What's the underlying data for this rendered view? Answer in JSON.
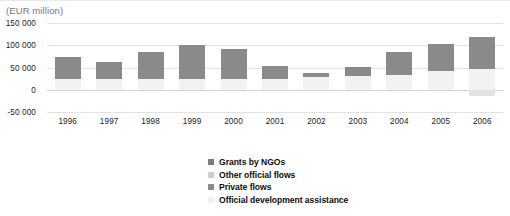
{
  "unit_caption": "(EUR million)",
  "legend": {
    "items": [
      {
        "label": "Grants by NGOs",
        "color": "#7d7d7d"
      },
      {
        "label": "Other official flows",
        "color": "#cfcfcf"
      },
      {
        "label": "Private flows",
        "color": "#8a8a8a"
      },
      {
        "label": "Official development assistance",
        "color": "#f2f2f2"
      }
    ]
  },
  "chart_data": {
    "type": "bar",
    "title": "",
    "subtitle": "",
    "xlabel": "",
    "ylabel": "(EUR million)",
    "ylim": [
      -50000,
      150000
    ],
    "yticks": [
      150000,
      100000,
      50000,
      0,
      -50000
    ],
    "ytick_labels": [
      "150 000",
      "100 000",
      "50 000",
      "0",
      "-50 000"
    ],
    "grid": true,
    "stacked": true,
    "legend_position": "bottom-center",
    "categories": [
      "1996",
      "1997",
      "1998",
      "1999",
      "2000",
      "2001",
      "2002",
      "2003",
      "2004",
      "2005",
      "2006"
    ],
    "series": [
      {
        "name": "Official development assistance",
        "color": "#f2f2f2",
        "values": [
          25000,
          25000,
          25000,
          25000,
          25000,
          25000,
          28000,
          30000,
          34000,
          42000,
          46000
        ]
      },
      {
        "name": "Private flows",
        "color": "#8a8a8a",
        "values": [
          48000,
          38000,
          60000,
          76000,
          66000,
          28000,
          10000,
          22000,
          50000,
          60000,
          72000
        ]
      },
      {
        "name": "Other official flows",
        "color": "#cfcfcf",
        "values": [
          0,
          0,
          0,
          0,
          0,
          0,
          0,
          0,
          0,
          0,
          -15000
        ]
      },
      {
        "name": "Grants by NGOs",
        "color": "#7d7d7d",
        "values": [
          0,
          0,
          0,
          0,
          0,
          0,
          0,
          0,
          0,
          0,
          0
        ]
      }
    ],
    "totals": [
      73000,
      63000,
      85000,
      101000,
      91000,
      53000,
      38000,
      52000,
      84000,
      102000,
      118000
    ],
    "negative_values": [
      0,
      0,
      0,
      0,
      0,
      0,
      0,
      0,
      0,
      0,
      -15000
    ]
  }
}
